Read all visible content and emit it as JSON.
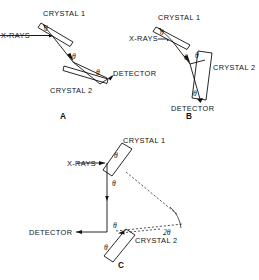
{
  "figure": {
    "background_color": "#ffffff",
    "line_color": "#111111",
    "width": 259,
    "height": 280
  },
  "panels": [
    {
      "id": "A",
      "label": "A",
      "label_x": 60,
      "label_y": 116,
      "arrangement": "dispersive (+,-) parallel-like setting",
      "source_label": "X-RAYS",
      "crystal1_label": "CRYSTAL 1",
      "crystal2_label": "CRYSTAL 2",
      "detector_label": "DETECTOR",
      "angles": [
        {
          "symbol": "θ",
          "x": 43,
          "y": 29
        },
        {
          "symbol": "θ",
          "x": 72,
          "y": 57
        },
        {
          "symbol": "θ",
          "x": 100,
          "y": 72
        }
      ]
    },
    {
      "id": "B",
      "label": "B",
      "label_x": 186,
      "label_y": 116,
      "arrangement": "non-dispersive (+,+) antiparallel setting",
      "source_label": "X-RAYS",
      "crystal1_label": "CRYSTAL 1",
      "crystal2_label": "CRYSTAL 2",
      "detector_label": "DETECTOR",
      "angles": [
        {
          "symbol": "θ",
          "x": 154,
          "y": 33
        },
        {
          "symbol": "θ",
          "x": 183,
          "y": 57
        },
        {
          "symbol": "θ",
          "x": 196,
          "y": 62
        },
        {
          "symbol": "θ",
          "x": 198,
          "y": 92
        }
      ]
    },
    {
      "id": "C",
      "label": "C",
      "label_x": 120,
      "label_y": 265,
      "arrangement": "channel-cut / parallel beam with 2θ deviation",
      "source_label": "X-RAYS",
      "crystal1_label": "CRYSTAL 1",
      "crystal2_label": "CRYSTAL 2",
      "detector_label": "DETECTOR",
      "deviation_label": "2θ",
      "angles": [
        {
          "symbol": "θ",
          "x": 118,
          "y": 156
        },
        {
          "symbol": "θ",
          "x": 130,
          "y": 183
        },
        {
          "symbol": "θ",
          "x": 118,
          "y": 226
        },
        {
          "symbol": "θ",
          "x": 107,
          "y": 247
        }
      ]
    }
  ],
  "text_items": {
    "a_xrays": "X-RAYS",
    "a_crystal1": "CRYSTAL 1",
    "a_crystal2": "CRYSTAL 2",
    "a_detector": "DETECTOR",
    "a_panel": "A",
    "b_xrays": "X-RAYS",
    "b_crystal1": "CRYSTAL 1",
    "b_crystal2": "CRYSTAL 2",
    "b_detector": "DETECTOR",
    "b_panel": "B",
    "c_xrays": "X-RAYS",
    "c_crystal1": "CRYSTAL 1",
    "c_crystal2": "CRYSTAL 2",
    "c_detector": "DETECTOR",
    "c_two_theta": "2θ",
    "c_panel": "C",
    "theta": "θ"
  }
}
